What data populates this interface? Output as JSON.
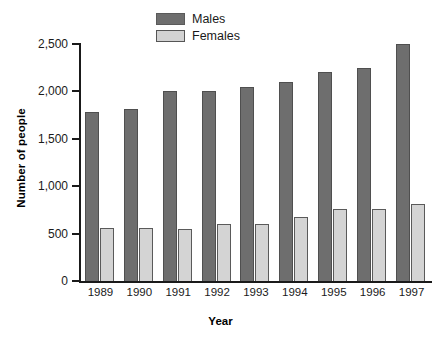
{
  "chart_data": {
    "type": "bar",
    "title": "",
    "xlabel": "Year",
    "ylabel": "Number of people",
    "categories": [
      "1989",
      "1990",
      "1991",
      "1992",
      "1993",
      "1994",
      "1995",
      "1996",
      "1997"
    ],
    "series": [
      {
        "name": "Males",
        "color": "#6e6e6e",
        "values": [
          1780,
          1810,
          2000,
          2000,
          2050,
          2100,
          2200,
          2250,
          2500
        ]
      },
      {
        "name": "Females",
        "color": "#d4d4d4",
        "values": [
          560,
          555,
          550,
          605,
          605,
          680,
          760,
          760,
          810
        ]
      }
    ],
    "ylim": [
      0,
      2500
    ],
    "yticks": [
      0,
      500,
      1000,
      1500,
      2000,
      2500
    ],
    "ytick_labels": [
      "0",
      "500",
      "1,000",
      "1,500",
      "2,000",
      "2,500"
    ],
    "grid": false,
    "legend_position": "top-center"
  },
  "legend": {
    "items": [
      {
        "label": "Males",
        "swatch": "males-swatch"
      },
      {
        "label": "Females",
        "swatch": "females-swatch"
      }
    ]
  },
  "axes": {
    "y_title": "Number of people",
    "x_title": "Year"
  }
}
